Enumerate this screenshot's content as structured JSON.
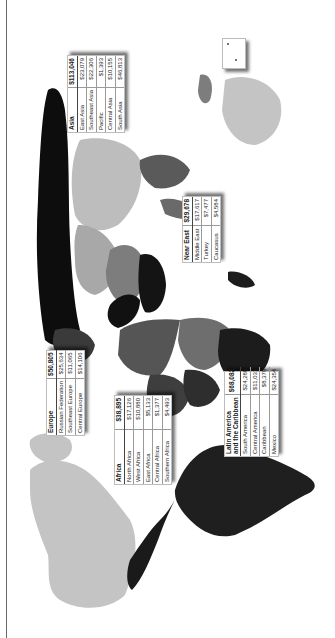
{
  "map": {
    "orientation": "rotated 90 degrees clockwise (north points left)",
    "shading_colors": {
      "darkest": "#0d0d0d",
      "dark": "#2e2e2e",
      "mid_dark": "#555555",
      "mid": "#7d7d7d",
      "light": "#a8a8a8",
      "lightest": "#c4c4c4"
    }
  },
  "regions": [
    {
      "name": "Asia",
      "total": "$113,046",
      "rows": [
        {
          "label": "East Asia",
          "value": "$23,079"
        },
        {
          "label": "Southeast Asia",
          "value": "$22,306"
        },
        {
          "label": "Pacific",
          "value": "$1,393"
        },
        {
          "label": "Central Asia",
          "value": "$10,155"
        },
        {
          "label": "South Asia",
          "value": "$46,813"
        }
      ]
    },
    {
      "name": "Near East",
      "total": "$29,678",
      "rows": [
        {
          "label": "Middle East",
          "value": "$17,617"
        },
        {
          "label": "Turkey",
          "value": "$7,477"
        },
        {
          "label": "Caucasus",
          "value": "$4,584"
        }
      ]
    },
    {
      "name": "Europe",
      "total": "$50,805",
      "rows": [
        {
          "label": "Russian Federation",
          "value": "$25,634"
        },
        {
          "label": "Southeast Europe",
          "value": "$11,065"
        },
        {
          "label": "Central Europe",
          "value": "$14,106"
        }
      ]
    },
    {
      "name": "Africa",
      "total": "$38,895",
      "rows": [
        {
          "label": "North Africa",
          "value": "$17,126"
        },
        {
          "label": "West Africa",
          "value": "$10,880"
        },
        {
          "label": "East Africa",
          "value": "$5,133"
        },
        {
          "label": "Central Africa",
          "value": "$1,377"
        },
        {
          "label": "Southern Africa",
          "value": "$4,493"
        }
      ]
    },
    {
      "name": "Latin America and the Caribbean",
      "name_line1": "Latin America",
      "name_line2": "and the Caribbean",
      "total": "$68,082",
      "rows": [
        {
          "label": "South America",
          "value": "$24,288"
        },
        {
          "label": "Central America",
          "value": "$11,031"
        },
        {
          "label": "Caribbean",
          "value": "$8,379"
        },
        {
          "label": "Mexico",
          "value": "$24,354"
        }
      ]
    }
  ]
}
